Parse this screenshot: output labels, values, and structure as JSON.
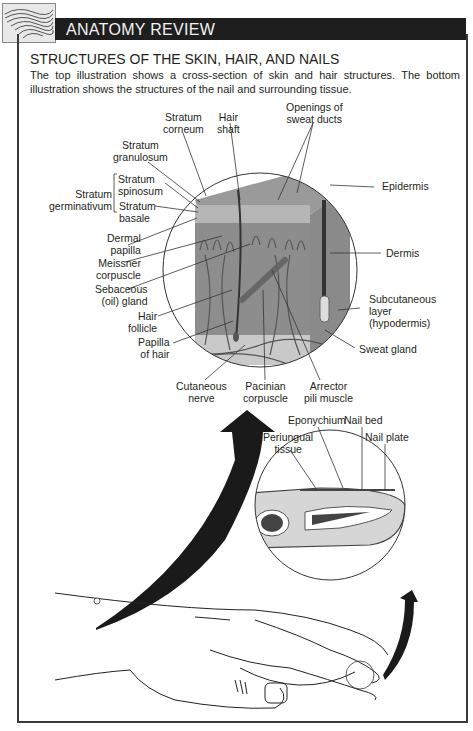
{
  "header": {
    "title": "ANATOMY REVIEW",
    "thumbnail_icon": "anatomy-thumbnail-icon"
  },
  "section": {
    "title": "STRUCTURES OF THE SKIN, HAIR, AND NAILS",
    "intro": "The top illustration shows a cross-section of skin and hair structures. The bottom illustration shows the structures of the nail and surrounding tissue."
  },
  "skin_diagram": {
    "labels": {
      "stratum_corneum": [
        "Stratum",
        "corneum"
      ],
      "hair_shaft": [
        "Hair",
        "shaft"
      ],
      "openings_sweat_ducts": [
        "Openings of",
        "sweat ducts"
      ],
      "stratum_granulosum": [
        "Stratum",
        "granulosum"
      ],
      "stratum_germinativum": [
        "Stratum",
        "germinativum"
      ],
      "stratum_spinosum": [
        "Stratum",
        "spinosum"
      ],
      "stratum_basale": [
        "Stratum",
        "basale"
      ],
      "epidermis": "Epidermis",
      "dermal_papilla": [
        "Dermal",
        "papilla"
      ],
      "meissner_corpuscle": [
        "Meissner",
        "corpuscle"
      ],
      "sebaceous_gland": [
        "Sebaceous",
        "(oil) gland"
      ],
      "hair_follicle": [
        "Hair",
        "follicle"
      ],
      "papilla_of_hair": [
        "Papilla",
        "of hair"
      ],
      "dermis": "Dermis",
      "subcutaneous_layer": [
        "Subcutaneous",
        "layer",
        "(hypodermis)"
      ],
      "sweat_gland": "Sweat gland",
      "cutaneous_nerve": [
        "Cutaneous",
        "nerve"
      ],
      "pacinian_corpuscle": [
        "Pacinian",
        "corpuscle"
      ],
      "arrector_pili_muscle": [
        "Arrector",
        "pili muscle"
      ]
    }
  },
  "nail_diagram": {
    "labels": {
      "eponychium": "Eponychium",
      "nail_bed": "Nail bed",
      "nail_plate": "Nail plate",
      "periungual_tissue": [
        "Periungual",
        "tissue"
      ]
    }
  }
}
